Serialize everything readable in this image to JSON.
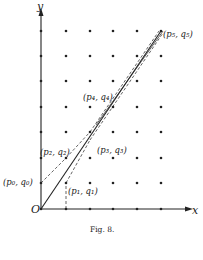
{
  "figure": {
    "caption": "Fig. 8.",
    "axis_x_label": "x",
    "axis_y_label": "y",
    "origin_label": "O",
    "points": [
      {
        "label": "(p₀, q₀)",
        "gx": 0,
        "gy": 1
      },
      {
        "label": "(p₁, q₁)",
        "gx": 1,
        "gy": 1
      },
      {
        "label": "(p₂, q₂)",
        "gx": 1,
        "gy": 2
      },
      {
        "label": "(p₃, q₃)",
        "gx": 2,
        "gy": 3
      },
      {
        "label": "(p₄, q₄)",
        "gx": 3,
        "gy": 4
      },
      {
        "label": "(p₅, q₅)",
        "gx": 5,
        "gy": 7
      }
    ],
    "grid": {
      "cols": 6,
      "rows": 8
    },
    "colors": {
      "ink": "#222222",
      "background": "#ffffff"
    }
  }
}
